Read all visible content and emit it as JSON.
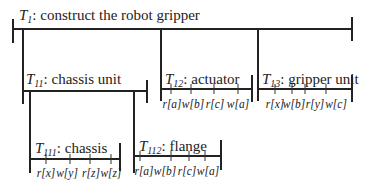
{
  "diagram": {
    "type": "transaction-tree",
    "nodes": [
      {
        "id": "T1",
        "letter": "T",
        "subscript": "1",
        "label": ": construct the robot gripper",
        "operations": []
      },
      {
        "id": "T11",
        "letter": "T",
        "subscript": "11",
        "label": ": chassis unit",
        "operations": []
      },
      {
        "id": "T12",
        "letter": "T",
        "subscript": "12",
        "label": ": actuator",
        "operations": [
          "r[a]",
          "w[b]",
          "r[c]",
          "w[a]"
        ]
      },
      {
        "id": "T13",
        "letter": "T",
        "subscript": "13",
        "label": ": gripper unit",
        "operations": [
          "r[x]",
          "w[b]",
          "r[y]",
          "w[c]"
        ]
      },
      {
        "id": "T111",
        "letter": "T",
        "subscript": "111",
        "label": ": chassis",
        "operations": [
          "r[x]",
          "w[y]",
          "r[z]",
          "w[z]"
        ]
      },
      {
        "id": "T112",
        "letter": "T",
        "subscript": "112",
        "label": ": flange",
        "operations": [
          "r[a]",
          "w[b]",
          "r[c]",
          "w[a]"
        ]
      }
    ],
    "edges": [
      {
        "from": "T1",
        "to": "T11"
      },
      {
        "from": "T1",
        "to": "T12"
      },
      {
        "from": "T1",
        "to": "T13"
      },
      {
        "from": "T11",
        "to": "T111"
      },
      {
        "from": "T11",
        "to": "T112"
      }
    ]
  }
}
